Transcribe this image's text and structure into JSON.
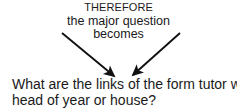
{
  "diagram": {
    "background_color": "#ffffff",
    "text_color": "#1a1a1a",
    "premise": {
      "line1": "THEREFORE",
      "line2": "the major question",
      "line3": "becomes"
    },
    "conclusion": {
      "line1": "What are the links of the form tutor with",
      "line2": "head of year or house?"
    },
    "arrows": {
      "color": "#111111",
      "left_arrow": {
        "name": "left-down-right-arrow",
        "from_x": 62,
        "from_y": 33,
        "to_x": 118,
        "to_y": 80
      },
      "right_arrow": {
        "name": "right-down-left-arrow",
        "from_x": 180,
        "from_y": 33,
        "to_x": 129,
        "to_y": 79
      }
    }
  }
}
